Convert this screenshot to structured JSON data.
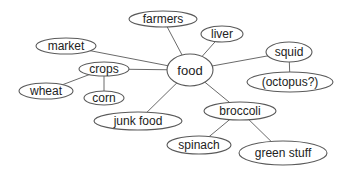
{
  "diagram": {
    "type": "concept map",
    "center": "food",
    "nodes": [
      {
        "id": "food",
        "label": "food",
        "cx": 190,
        "cy": 70,
        "rx": 23,
        "ry": 16
      },
      {
        "id": "farmers",
        "label": "farmers",
        "cx": 163,
        "cy": 19,
        "rx": 34,
        "ry": 8
      },
      {
        "id": "liver",
        "label": "liver",
        "cx": 222,
        "cy": 34,
        "rx": 21,
        "ry": 8
      },
      {
        "id": "squid",
        "label": "squid",
        "cx": 289,
        "cy": 52,
        "rx": 23,
        "ry": 10
      },
      {
        "id": "octopus",
        "label": "(octopus?)",
        "cx": 290,
        "cy": 82,
        "rx": 43,
        "ry": 10
      },
      {
        "id": "market",
        "label": "market",
        "cx": 66,
        "cy": 46,
        "rx": 30,
        "ry": 8
      },
      {
        "id": "crops",
        "label": "crops",
        "cx": 104,
        "cy": 69,
        "rx": 25,
        "ry": 7
      },
      {
        "id": "wheat",
        "label": "wheat",
        "cx": 46,
        "cy": 91,
        "rx": 27,
        "ry": 8
      },
      {
        "id": "corn",
        "label": "corn",
        "cx": 104,
        "cy": 98,
        "rx": 20,
        "ry": 7
      },
      {
        "id": "junkfood",
        "label": "junk food",
        "cx": 138,
        "cy": 121,
        "rx": 44,
        "ry": 9
      },
      {
        "id": "broccoli",
        "label": "broccoli",
        "cx": 240,
        "cy": 111,
        "rx": 36,
        "ry": 9
      },
      {
        "id": "spinach",
        "label": "spinach",
        "cx": 199,
        "cy": 145,
        "rx": 32,
        "ry": 9
      },
      {
        "id": "greenstuff",
        "label": "green stuff",
        "cx": 283,
        "cy": 153,
        "rx": 44,
        "ry": 12
      }
    ],
    "edges": [
      {
        "from": "food",
        "to": "farmers"
      },
      {
        "from": "food",
        "to": "liver"
      },
      {
        "from": "food",
        "to": "squid"
      },
      {
        "from": "squid",
        "to": "octopus"
      },
      {
        "from": "food",
        "to": "market"
      },
      {
        "from": "food",
        "to": "crops"
      },
      {
        "from": "crops",
        "to": "wheat"
      },
      {
        "from": "crops",
        "to": "corn"
      },
      {
        "from": "food",
        "to": "junkfood"
      },
      {
        "from": "food",
        "to": "broccoli"
      },
      {
        "from": "broccoli",
        "to": "spinach"
      },
      {
        "from": "broccoli",
        "to": "greenstuff"
      }
    ],
    "colors": {
      "background": "#ffffff",
      "stroke": "#5a5a5a",
      "text": "#222222"
    }
  }
}
